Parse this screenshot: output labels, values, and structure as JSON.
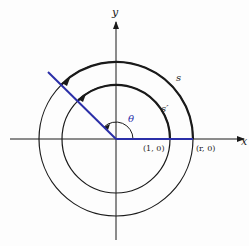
{
  "labels": {
    "x_axis": "x",
    "y_axis": "y",
    "outer_arc": "s",
    "inner_arc": "s′",
    "angle": "θ",
    "unit_point": "(1, 0)",
    "r_point": "(r, 0)"
  },
  "colors": {
    "line": "#1a1a1a",
    "accent": "#2b2fa8"
  }
}
